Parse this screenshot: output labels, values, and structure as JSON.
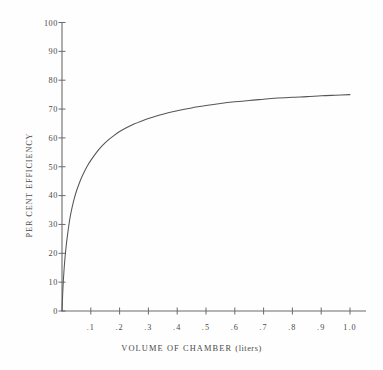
{
  "chart_data": {
    "type": "line",
    "title": "",
    "subtitle": "",
    "xlabel": "VOLUME OF CHAMBER (liters)",
    "ylabel": "PER CENT EFFICIENCY",
    "xlabel_main": "VOLUME OF CHAMBER",
    "xlabel_unit": "(liters)",
    "xlim": [
      0.0,
      1.05
    ],
    "ylim": [
      0,
      100
    ],
    "grid": false,
    "legend": null,
    "legend_position": "none",
    "x_ticks": [
      0.1,
      0.2,
      0.3,
      0.4,
      0.5,
      0.6,
      0.7,
      0.8,
      0.9,
      1.0
    ],
    "x_tick_labels": [
      ".1",
      ".2",
      ".3",
      ".4",
      ".5",
      ".6",
      ".7",
      ".8",
      ".9",
      "1.0"
    ],
    "y_ticks": [
      0,
      10,
      20,
      30,
      40,
      50,
      60,
      70,
      80,
      90,
      100
    ],
    "y_tick_labels": [
      "0",
      "10",
      "20",
      "30",
      "40",
      "50",
      "60",
      "70",
      "80",
      "90",
      "100"
    ],
    "series": [
      {
        "name": "efficiency",
        "color": "#555555",
        "x": [
          0.0,
          0.002,
          0.005,
          0.01,
          0.015,
          0.02,
          0.025,
          0.03,
          0.04,
          0.05,
          0.06,
          0.07,
          0.08,
          0.09,
          0.1,
          0.12,
          0.14,
          0.16,
          0.18,
          0.2,
          0.225,
          0.25,
          0.275,
          0.3,
          0.35,
          0.4,
          0.45,
          0.5,
          0.55,
          0.6,
          0.65,
          0.7,
          0.75,
          0.8,
          0.85,
          0.9,
          0.95,
          1.0
        ],
        "y": [
          0.0,
          5.0,
          11.0,
          18.0,
          23.0,
          27.0,
          30.5,
          33.5,
          38.0,
          41.5,
          44.3,
          46.7,
          48.8,
          50.6,
          52.2,
          55.0,
          57.3,
          59.2,
          60.8,
          62.2,
          63.6,
          64.8,
          65.8,
          66.7,
          68.2,
          69.4,
          70.4,
          71.2,
          71.9,
          72.5,
          73.0,
          73.4,
          73.8,
          74.1,
          74.3,
          74.6,
          74.8,
          75.0
        ]
      }
    ],
    "plateau_value": 75,
    "curve_description": "Rises steeply from origin and saturates near 75 per cent"
  },
  "axes": {
    "y_axis_name": "per-cent-efficiency-axis",
    "x_axis_name": "volume-of-chamber-axis"
  },
  "style": {
    "background": "#fefefe",
    "axis_color": "#6b6b6b",
    "curve_color": "#555555",
    "text_color": "#4a4a4a"
  }
}
